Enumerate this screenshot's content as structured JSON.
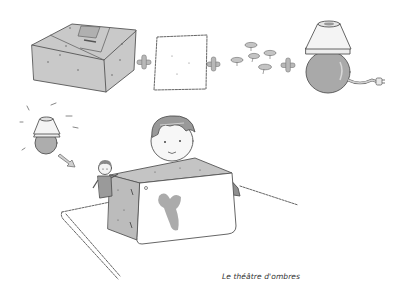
{
  "caption": "Le théâtre d'ombres",
  "illustration": {
    "row1": [
      "cardboard-box",
      "plus",
      "paper-sheet",
      "plus",
      "push-pins",
      "plus",
      "lamp"
    ],
    "row2": [
      "glowing-lamp",
      "arrow",
      "finger-puppet",
      "child",
      "box-theatre",
      "table"
    ],
    "colors": {
      "box_fill": "#c9c9c9",
      "box_fill_dark": "#b5b5b5",
      "paper_fill": "#ffffff",
      "lamp_shade": "#f2f2f2",
      "lamp_bulb": "#a9a9a9",
      "plus_sign": "#b8b8b8",
      "shadow_figure": "#9c9c9c",
      "child_shirt": "#8f8f8f",
      "hair": "#999999",
      "outline": "#555555"
    }
  }
}
